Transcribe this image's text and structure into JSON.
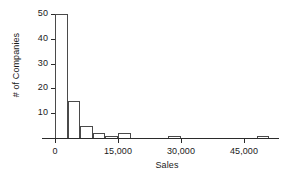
{
  "chart_data": {
    "type": "bar",
    "title": "",
    "subtitle": "",
    "xlabel": "Sales",
    "ylabel": "# of Companies",
    "xlim": [
      -3000,
      54000
    ],
    "ylim": [
      0,
      52
    ],
    "grid": false,
    "legend": null,
    "xticks": [
      0,
      15000,
      30000,
      45000
    ],
    "xtick_labels": [
      "0",
      "15,000",
      "30,000",
      "45,000"
    ],
    "yticks": [
      10,
      20,
      30,
      40,
      50
    ],
    "ytick_labels": [
      "10",
      "20",
      "30",
      "40",
      "50"
    ],
    "bin_width": 3000,
    "bins": [
      {
        "x0": 0,
        "x1": 3000,
        "value": 50
      },
      {
        "x0": 3000,
        "x1": 6000,
        "value": 15
      },
      {
        "x0": 6000,
        "x1": 9000,
        "value": 5
      },
      {
        "x0": 9000,
        "x1": 12000,
        "value": 2
      },
      {
        "x0": 12000,
        "x1": 15000,
        "value": 1
      },
      {
        "x0": 15000,
        "x1": 18000,
        "value": 2
      },
      {
        "x0": 27000,
        "x1": 30000,
        "value": 1
      },
      {
        "x0": 48000,
        "x1": 51000,
        "value": 1
      }
    ],
    "categories": [
      "0-3,000",
      "3,000-6,000",
      "6,000-9,000",
      "9,000-12,000",
      "12,000-15,000",
      "15,000-18,000",
      "27,000-30,000",
      "48,000-51,000"
    ],
    "values": [
      50,
      15,
      5,
      2,
      1,
      2,
      1,
      1
    ],
    "colors": {
      "bar_fill": "#ffffff",
      "bar_edge": "#4a4a4a",
      "axis": "#2b2b2b",
      "text": "#1a1a1a",
      "background": "#ffffff"
    }
  }
}
